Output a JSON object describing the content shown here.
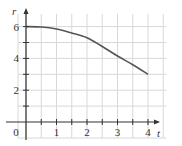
{
  "chart_data": {
    "type": "line",
    "title": "",
    "xlabel": "t",
    "ylabel": "r",
    "xlim": [
      0,
      4.5
    ],
    "ylim": [
      0,
      6.8
    ],
    "x_ticks": [
      0,
      1,
      2,
      3,
      4
    ],
    "x_tick_labels": [
      "0",
      "1",
      "2",
      "3",
      "4"
    ],
    "y_ticks": [
      2,
      4,
      6
    ],
    "y_tick_labels": [
      "2",
      "4",
      "6"
    ],
    "grid": true,
    "legend": null,
    "series": [
      {
        "name": "r(t)",
        "x": [
          0,
          0.5,
          1,
          1.5,
          2,
          2.5,
          3,
          3.5,
          4
        ],
        "values": [
          6.0,
          5.97,
          5.85,
          5.6,
          5.3,
          4.75,
          4.15,
          3.6,
          3.0
        ]
      }
    ],
    "colors": {
      "curve": "#555555",
      "grid": "#d8d8d8",
      "axis": "#333333"
    }
  }
}
